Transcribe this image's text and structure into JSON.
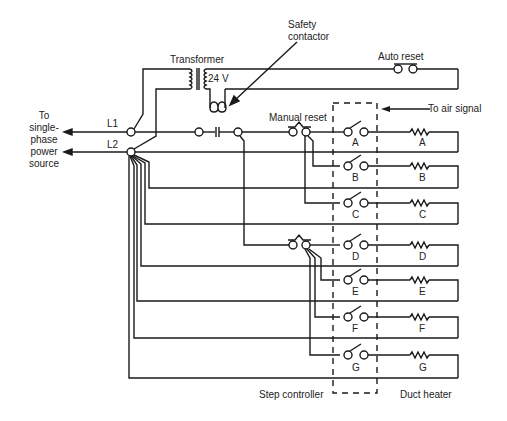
{
  "labels": {
    "source": [
      "To",
      "single-",
      "phase",
      "power",
      "source"
    ],
    "l1": "L1",
    "l2": "L2",
    "transformer": "Transformer",
    "voltage": "24 V",
    "safety_contactor": [
      "Safety",
      "contactor"
    ],
    "auto_reset": "Auto reset",
    "manual_reset": "Manual reset",
    "air_signal": "To air signal",
    "step_controller": "Step controller",
    "duct_heater": "Duct heater"
  },
  "stages": [
    {
      "id": "A",
      "switch_label": "A",
      "heater_label": "A"
    },
    {
      "id": "B",
      "switch_label": "B",
      "heater_label": "B"
    },
    {
      "id": "C",
      "switch_label": "C",
      "heater_label": "C"
    },
    {
      "id": "D",
      "switch_label": "D",
      "heater_label": "D"
    },
    {
      "id": "E",
      "switch_label": "E",
      "heater_label": "E"
    },
    {
      "id": "F",
      "switch_label": "F",
      "heater_label": "F"
    },
    {
      "id": "G",
      "switch_label": "G",
      "heater_label": "G"
    }
  ],
  "colors": {
    "line": "#1a1a1a",
    "background": "#ffffff"
  }
}
